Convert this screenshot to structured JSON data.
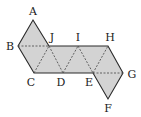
{
  "diagram": {
    "type": "net-of-solid",
    "fill_color": "#d3d3d3",
    "stroke_color": "#2a2a2a",
    "vertices": {
      "A": {
        "label": "A",
        "x": 33,
        "y": 20,
        "lx": 33,
        "ly": 15
      },
      "B": {
        "label": "B",
        "x": 18,
        "y": 46,
        "lx": 10,
        "ly": 50
      },
      "C": {
        "label": "C",
        "x": 34,
        "y": 73,
        "lx": 31,
        "ly": 86
      },
      "D": {
        "label": "D",
        "x": 63,
        "y": 73,
        "lx": 61,
        "ly": 86
      },
      "E": {
        "label": "E",
        "x": 93,
        "y": 73,
        "lx": 89,
        "ly": 86
      },
      "F": {
        "label": "F",
        "x": 108,
        "y": 99,
        "lx": 108,
        "ly": 112
      },
      "G": {
        "label": "G",
        "x": 123,
        "y": 73,
        "lx": 132,
        "ly": 78
      },
      "H": {
        "label": "H",
        "x": 108,
        "y": 46,
        "lx": 110,
        "ly": 41
      },
      "I": {
        "label": "I",
        "x": 78,
        "y": 46,
        "lx": 78,
        "ly": 41
      },
      "J": {
        "label": "J",
        "x": 49,
        "y": 46,
        "lx": 52,
        "ly": 41
      }
    }
  }
}
